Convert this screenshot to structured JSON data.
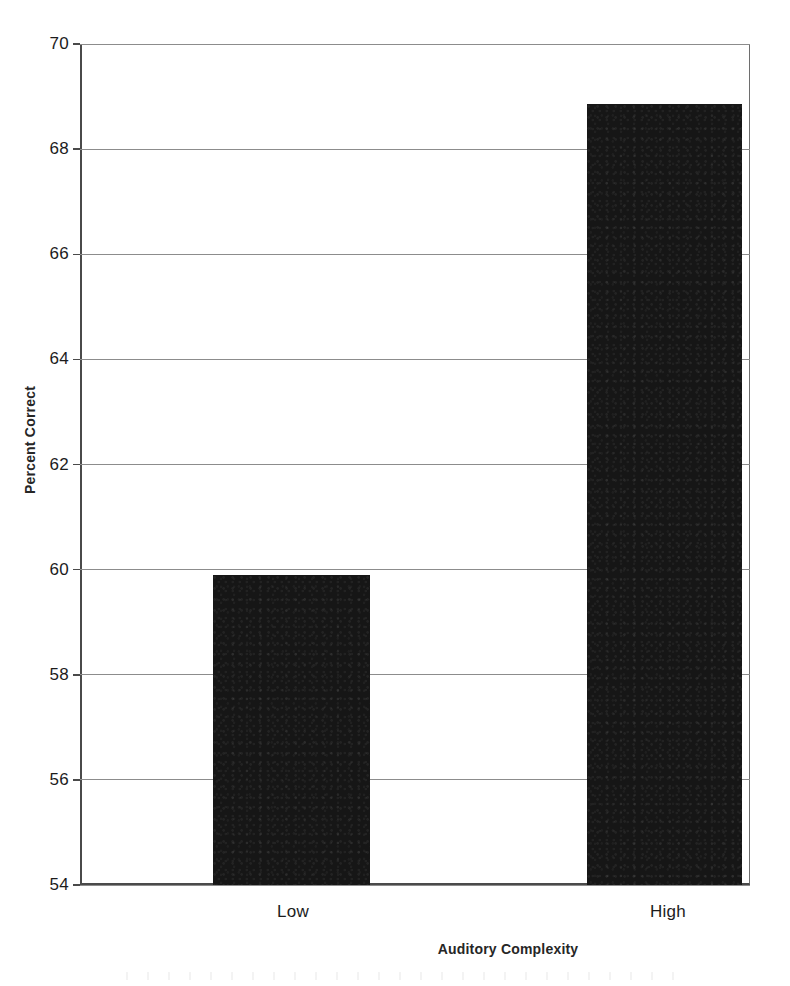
{
  "chart_data": {
    "type": "bar",
    "title": "",
    "subtitle": "",
    "xlabel": "Auditory Complexity",
    "ylabel": "Percent Correct",
    "categories": [
      "Low",
      "High"
    ],
    "values": [
      59.9,
      68.85
    ],
    "ylim": [
      54,
      70
    ],
    "yticks": [
      54,
      56,
      58,
      60,
      62,
      64,
      66,
      68,
      70
    ],
    "ytick_labels": [
      "54",
      "56",
      "58",
      "60",
      "62",
      "64",
      "66",
      "68",
      "70"
    ],
    "grid": "horizontal",
    "legend": "none",
    "bar_color": "#161616",
    "gridline_color": "#8c8c8c",
    "axis_color": "#4a4a4a",
    "annotations": []
  },
  "figure": {
    "y_axis_title": "Percent Correct",
    "x_axis_title": "Auditory Complexity",
    "x_tick_low": "Low",
    "x_tick_high": "High",
    "y_tick_70": "70",
    "y_tick_68": "68",
    "y_tick_66": "66",
    "y_tick_64": "64",
    "y_tick_62": "62",
    "y_tick_60": "60",
    "y_tick_58": "58",
    "y_tick_56": "56",
    "y_tick_54": "54"
  }
}
